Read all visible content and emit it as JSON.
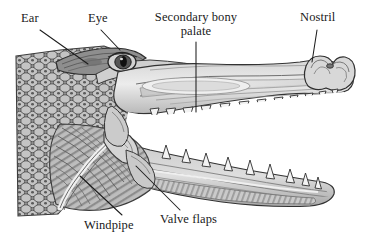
{
  "figure": {
    "background_color": "#ffffff",
    "line_color": "#1a1a1a",
    "fill_light": "#e8e8e8",
    "fill_mid": "#b8b8b8",
    "fill_dark": "#8a8a8a",
    "fill_darker": "#6a6a6a"
  },
  "labels": {
    "ear": "Ear",
    "eye": "Eye",
    "secondary_bony_palate": "Secondary bony palate",
    "nostril": "Nostril",
    "windpipe": "Windpipe",
    "valve_flaps": "Valve flaps"
  },
  "leaders": [
    {
      "name": "ear-leader",
      "from": [
        40,
        30
      ],
      "to": [
        86,
        63
      ]
    },
    {
      "name": "eye-leader",
      "from": [
        100,
        30
      ],
      "to": [
        122,
        50
      ]
    },
    {
      "name": "palate-leader",
      "from": [
        196,
        42
      ],
      "to": [
        196,
        110
      ]
    },
    {
      "name": "nostril-leader",
      "from": [
        317,
        30
      ],
      "to": [
        311,
        62
      ]
    },
    {
      "name": "windpipe-leader",
      "from": [
        122,
        216
      ],
      "to": [
        78,
        176
      ]
    },
    {
      "name": "valve-leader",
      "from": [
        180,
        211
      ],
      "to": [
        137,
        166
      ]
    }
  ]
}
